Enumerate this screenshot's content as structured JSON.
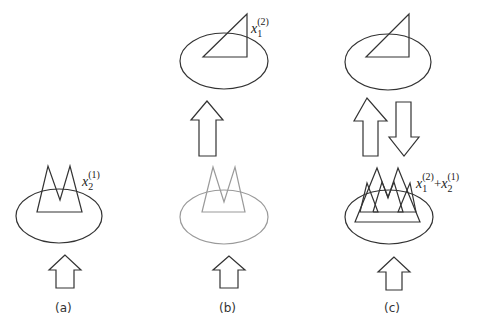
{
  "figure": {
    "panels": [
      {
        "id": "a",
        "caption": "(a)",
        "label": {
          "var": "x",
          "sub": "2",
          "sup": "(1)"
        }
      },
      {
        "id": "b",
        "caption": "(b)",
        "label": {
          "var": "x",
          "sub": "1",
          "sup": "(2)"
        }
      },
      {
        "id": "c",
        "caption": "(c)",
        "label": {
          "term1": {
            "var": "x",
            "sub": "1",
            "sup": "(2)"
          },
          "op": "+",
          "term2": {
            "var": "x",
            "sub": "2",
            "sup": "(1)"
          }
        }
      }
    ],
    "colors": {
      "stroke": "#333333",
      "faded_stroke": "#9a9a9a",
      "background": "#ffffff"
    },
    "icons": {
      "up_arrow": "block-arrow-up",
      "down_arrow": "block-arrow-down"
    }
  }
}
